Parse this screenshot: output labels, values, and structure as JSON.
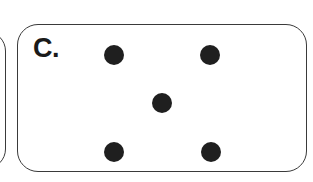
{
  "figure": {
    "type": "dot-pattern-panel",
    "panel_label": "C.",
    "background_color": "#ffffff",
    "border_color": "#3a3a3a",
    "dot_color": "#1f1f1f",
    "label_color": "#1a1a1a"
  },
  "panels": {
    "partial_left": {
      "name": "clipped-neighbor-panel",
      "visible_fragment": "right-edge-only"
    },
    "main": {
      "name": "panel-c",
      "label": "C.",
      "corner_radius_px": 21
    }
  },
  "chart_data": {
    "type": "scatter",
    "title": "C.",
    "xlabel": "",
    "ylabel": "",
    "xlim": [
      17,
      307
    ],
    "ylim": [
      24,
      172
    ],
    "grid": false,
    "legend": null,
    "arrangement": "quincunx",
    "dot_count": 5,
    "dot_diameter_px": 20,
    "series": [
      {
        "name": "dots",
        "color": "#1f1f1f",
        "points": [
          {
            "id": "top-left",
            "x": 115,
            "y": 56
          },
          {
            "id": "top-right",
            "x": 211,
            "y": 56
          },
          {
            "id": "center",
            "x": 163,
            "y": 104
          },
          {
            "id": "bottom-left",
            "x": 115,
            "y": 153
          },
          {
            "id": "bottom-right",
            "x": 212,
            "y": 153
          }
        ]
      }
    ]
  }
}
